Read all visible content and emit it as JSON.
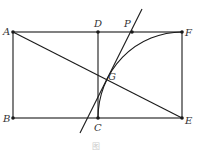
{
  "diagram": {
    "stroke_color": "#1a1a1a",
    "points": {
      "A": {
        "label": "A",
        "x": 13,
        "y": 32
      },
      "B": {
        "label": "B",
        "x": 13,
        "y": 118
      },
      "C": {
        "label": "C",
        "x": 98,
        "y": 118
      },
      "D": {
        "label": "D",
        "x": 98,
        "y": 32
      },
      "E": {
        "label": "E",
        "x": 182,
        "y": 118
      },
      "F": {
        "label": "F",
        "x": 182,
        "y": 32
      },
      "G": {
        "label": "G",
        "x": 107,
        "y": 80
      },
      "P": {
        "label": "P",
        "x": 132,
        "y": 32
      }
    },
    "caption": "图"
  }
}
